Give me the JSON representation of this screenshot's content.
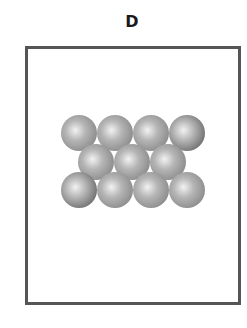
{
  "panel": {
    "label": "D"
  },
  "diagram": {
    "sphere_radius": 18,
    "rows": [
      {
        "y": 133,
        "x": [
          79,
          115,
          151,
          187
        ],
        "shades": [
          "#8a8a8a",
          "#8a8a8a",
          "#8a8a8a",
          "#6e6e6e"
        ]
      },
      {
        "y": 162,
        "x": [
          96,
          132,
          168
        ],
        "shades": [
          "#8a8a8a",
          "#8a8a8a",
          "#8a8a8a"
        ]
      },
      {
        "y": 190,
        "x": [
          79,
          115,
          151,
          187
        ],
        "shades": [
          "#6e6e6e",
          "#8a8a8a",
          "#8a8a8a",
          "#8a8a8a"
        ]
      }
    ],
    "colors": {
      "frame": "#555555",
      "highlight": "#f2f2f2"
    }
  }
}
